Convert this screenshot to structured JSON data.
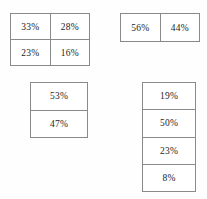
{
  "document": {
    "kind": "percentage-tables-sheet",
    "background_color": "#fefefe",
    "border_color": "#8a8a8a",
    "text_color": "#1d1d1d"
  },
  "chart_data": [
    {
      "type": "table",
      "name": "top-left-grid",
      "title": "",
      "rows": 2,
      "cols": 2,
      "values": [
        [
          "33%",
          "28%"
        ],
        [
          "23%",
          "16%"
        ]
      ],
      "numeric_values": [
        [
          33,
          28
        ],
        [
          23,
          16
        ]
      ],
      "unit": "%"
    },
    {
      "type": "table",
      "name": "top-right-row",
      "title": "",
      "rows": 1,
      "cols": 2,
      "values": [
        [
          "56%",
          "44%"
        ]
      ],
      "numeric_values": [
        [
          56,
          44
        ]
      ],
      "unit": "%"
    },
    {
      "type": "table",
      "name": "bottom-left-column",
      "title": "",
      "rows": 2,
      "cols": 1,
      "values": [
        [
          "53%"
        ],
        [
          "47%"
        ]
      ],
      "numeric_values": [
        [
          53
        ],
        [
          47
        ]
      ],
      "unit": "%"
    },
    {
      "type": "table",
      "name": "bottom-right-column",
      "title": "",
      "rows": 4,
      "cols": 1,
      "values": [
        [
          "19%"
        ],
        [
          "50%"
        ],
        [
          "23%"
        ],
        [
          "8%"
        ]
      ],
      "numeric_values": [
        [
          19
        ],
        [
          50
        ],
        [
          23
        ],
        [
          8
        ]
      ],
      "unit": "%"
    }
  ],
  "tables": {
    "top_left": {
      "r0c0": "33%",
      "r0c1": "28%",
      "r1c0": "23%",
      "r1c1": "16%"
    },
    "top_right": {
      "r0c0": "56%",
      "r0c1": "44%"
    },
    "bottom_left": {
      "r0c0": "53%",
      "r1c0": "47%"
    },
    "bottom_right": {
      "r0c0": "19%",
      "r1c0": "50%",
      "r2c0": "23%",
      "r3c0": "8%"
    }
  }
}
